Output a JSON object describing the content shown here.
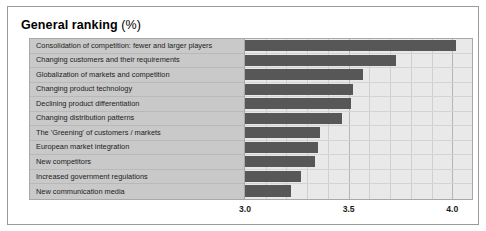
{
  "chart": {
    "title_main": "General ranking",
    "title_unit": "(%)",
    "bar_color": "#575757",
    "label_panel_color": "#c9c9c9",
    "plot_bg_color": "#e9e9e9",
    "frame_color": "#9a9a9a"
  },
  "chart_data": {
    "type": "bar",
    "orientation": "horizontal",
    "title": "General ranking (%)",
    "xlabel": "",
    "ylabel": "",
    "xlim": [
      3.0,
      4.1
    ],
    "grid": true,
    "legend": "none",
    "xticks": [
      "3.0",
      "3.5",
      "4.0"
    ],
    "xtick_values": [
      3.0,
      3.5,
      4.0
    ],
    "categories": [
      "Consolidation of competition: fewer and larger players",
      "Changing customers and their requirements",
      "Globalization of markets and competition",
      "Changing product technology",
      "Declining product differentiation",
      "Changing distribution patterns",
      "The 'Greening' of customers / markets",
      "European market integration",
      "New competitors",
      "Increased government regulations",
      "New communication media"
    ],
    "values": [
      4.02,
      3.73,
      3.57,
      3.52,
      3.51,
      3.47,
      3.36,
      3.35,
      3.34,
      3.27,
      3.22
    ]
  }
}
